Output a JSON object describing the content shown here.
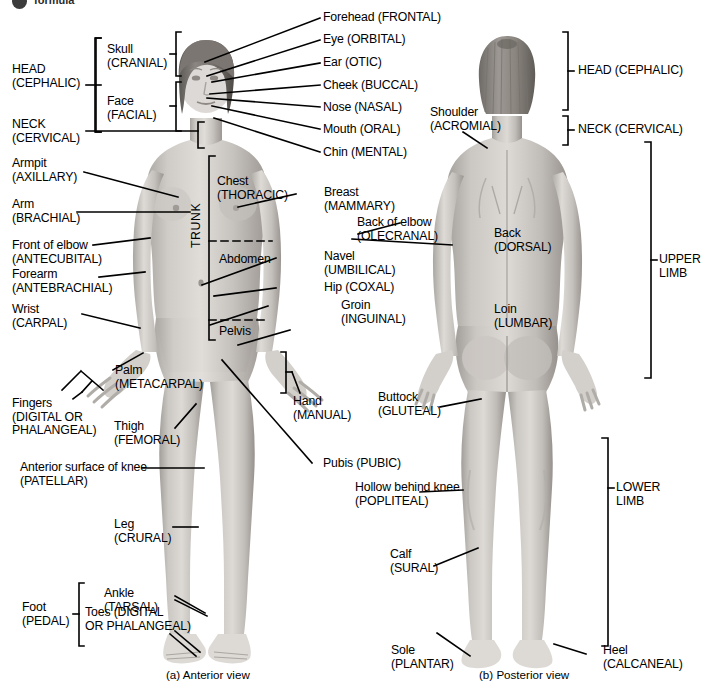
{
  "figure": {
    "title_fragment": "formula",
    "captions": {
      "anterior": "(a) Anterior view",
      "posterior": "(b) Posterior view"
    }
  },
  "anterior": {
    "bracket_groups": [
      {
        "name": "head",
        "line1": "HEAD",
        "line2": "(CEPHALIC)"
      },
      {
        "name": "neck",
        "line1": "NECK",
        "line2": "(CERVICAL)"
      },
      {
        "name": "skull",
        "line1": "Skull",
        "line2": "(CRANIAL)"
      },
      {
        "name": "face",
        "line1": "Face",
        "line2": "(FACIAL)"
      },
      {
        "name": "trunk",
        "line1": "TRUNK"
      },
      {
        "name": "hand",
        "line1": "Hand",
        "line2": "(MANUAL)"
      },
      {
        "name": "fingers",
        "line1": "Fingers",
        "line2": "(DIGITAL OR",
        "line3": "PHALANGEAL)"
      },
      {
        "name": "foot",
        "line1": "Foot",
        "line2": "(PEDAL)"
      }
    ],
    "head_labels": [
      {
        "name": "forehead",
        "text": "Forehead (FRONTAL)"
      },
      {
        "name": "eye",
        "text": "Eye (ORBITAL)"
      },
      {
        "name": "ear",
        "text": "Ear (OTIC)"
      },
      {
        "name": "cheek",
        "text": "Cheek (BUCCAL)"
      },
      {
        "name": "nose",
        "text": "Nose (NASAL)"
      },
      {
        "name": "mouth",
        "text": "Mouth (ORAL)"
      },
      {
        "name": "chin",
        "text": "Chin (MENTAL)"
      }
    ],
    "left_labels": [
      {
        "name": "armpit",
        "line1": "Armpit",
        "line2": "(AXILLARY)"
      },
      {
        "name": "arm",
        "line1": "Arm",
        "line2": "(BRACHIAL)"
      },
      {
        "name": "front-of-elbow",
        "line1": "Front of elbow",
        "line2": "(ANTECUBITAL)"
      },
      {
        "name": "forearm",
        "line1": "Forearm",
        "line2": "(ANTEBRACHIAL)"
      },
      {
        "name": "wrist",
        "line1": "Wrist",
        "line2": "(CARPAL)"
      },
      {
        "name": "palm",
        "line1": "Palm",
        "line2": "(METACARPAL)"
      },
      {
        "name": "thigh",
        "line1": "Thigh",
        "line2": "(FEMORAL)"
      },
      {
        "name": "knee",
        "line1": "Anterior surface of knee",
        "line2": "(PATELLAR)"
      },
      {
        "name": "leg",
        "line1": "Leg",
        "line2": "(CRURAL)"
      },
      {
        "name": "ankle",
        "line1": "Ankle",
        "line2": "(TARSAL)"
      },
      {
        "name": "toes",
        "line1": "Toes (DIGITAL",
        "line2": "OR PHALANGEAL)"
      }
    ],
    "trunk_labels": [
      {
        "name": "chest",
        "line1": "Chest",
        "line2": "(THORACIC)"
      },
      {
        "name": "abdomen",
        "line1": "Abdomen"
      },
      {
        "name": "pelvis",
        "line1": "Pelvis"
      }
    ],
    "right_labels": [
      {
        "name": "breast",
        "line1": "Breast",
        "line2": "(MAMMARY)"
      },
      {
        "name": "back-of-elbow",
        "line1": "Back of elbow",
        "line2": "(OLECRANAL)"
      },
      {
        "name": "navel",
        "line1": "Navel",
        "line2": "(UMBILICAL)"
      },
      {
        "name": "hip",
        "line1": "Hip (COXAL)"
      },
      {
        "name": "groin",
        "line1": "Groin",
        "line2": "(INGUINAL)"
      },
      {
        "name": "pubis",
        "line1": "Pubis (PUBIC)"
      }
    ]
  },
  "posterior": {
    "bracket_labels": [
      {
        "name": "head",
        "text": "HEAD (CEPHALIC)"
      },
      {
        "name": "neck",
        "text": "NECK (CERVICAL)"
      },
      {
        "name": "upper-limb",
        "line1": "UPPER",
        "line2": "LIMB"
      },
      {
        "name": "lower-limb",
        "line1": "LOWER",
        "line2": "LIMB"
      }
    ],
    "labels": [
      {
        "name": "shoulder",
        "line1": "Shoulder",
        "line2": "(ACROMIAL)"
      },
      {
        "name": "back",
        "line1": "Back",
        "line2": "(DORSAL)"
      },
      {
        "name": "loin",
        "line1": "Loin",
        "line2": "(LUMBAR)"
      },
      {
        "name": "buttock",
        "line1": "Buttock",
        "line2": "(GLUTEAL)"
      },
      {
        "name": "popliteal",
        "line1": "Hollow behind knee",
        "line2": "(POPLITEAL)"
      },
      {
        "name": "calf",
        "line1": "Calf",
        "line2": "(SURAL)"
      },
      {
        "name": "sole",
        "line1": "Sole",
        "line2": "(PLANTAR)"
      },
      {
        "name": "heel",
        "line1": "Heel",
        "line2": "(CALCANEAL)"
      }
    ]
  },
  "colors": {
    "ink": "#000000",
    "skin_light": "#d8d5d1",
    "skin_mid": "#bdb9b4",
    "skin_dark": "#9b9691",
    "hair_dark": "#6b6762",
    "hair_mid": "#8d8883"
  }
}
